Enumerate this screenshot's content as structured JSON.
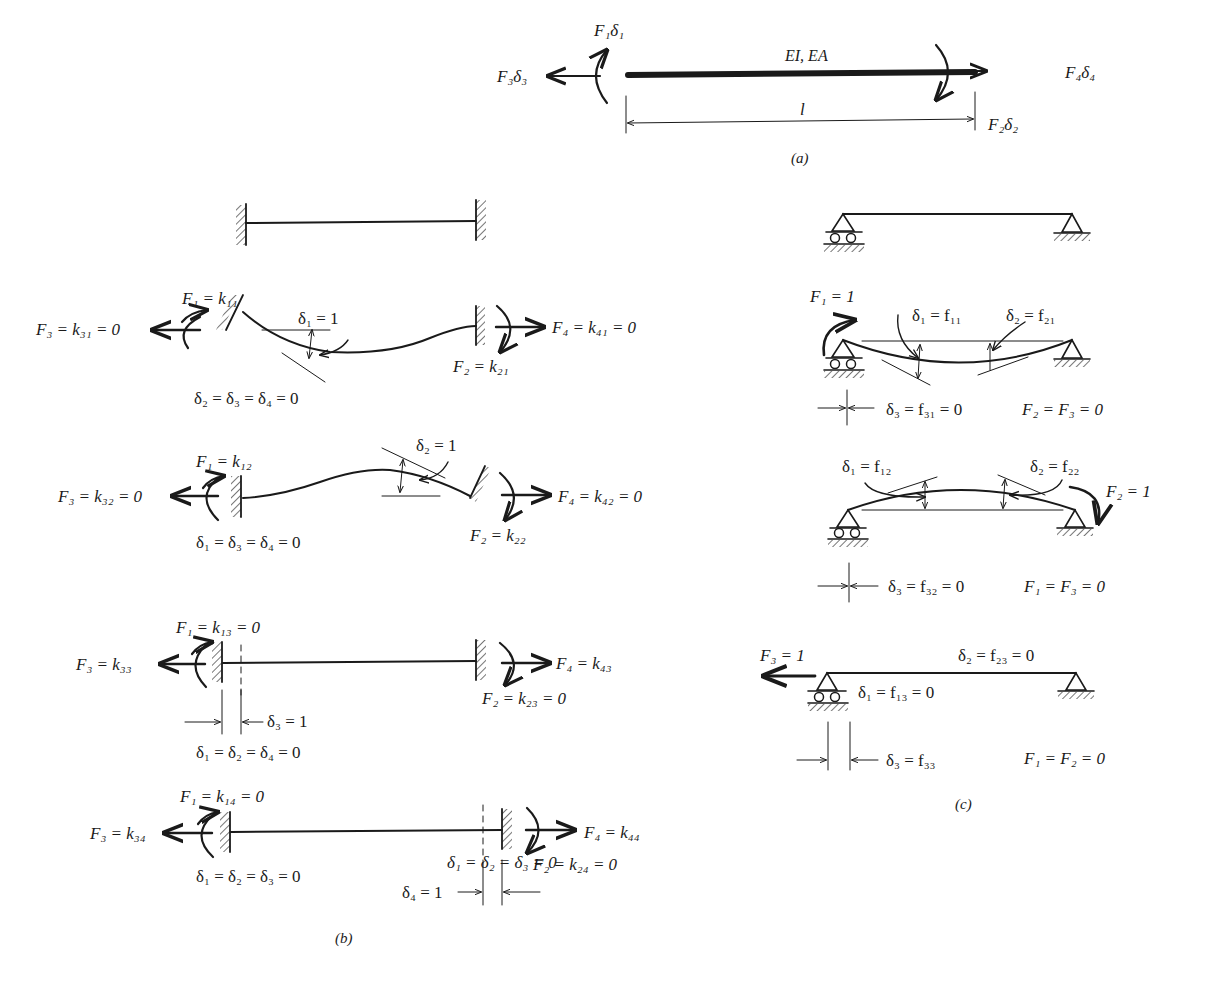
{
  "figure": {
    "panel_a": {
      "caption": "(a)",
      "beam_label": "EI, EA",
      "length_label": "l",
      "labels": {
        "f1": "F₁δ₁",
        "f2": "F₂δ₂",
        "f3": "F₃δ₃",
        "f4": "F₄δ₄"
      }
    },
    "panel_b": {
      "caption": "(b)",
      "case1": {
        "f1": "F₁ = k₁₁",
        "f3": "F₃ = k₃₁ = 0",
        "f4": "F₄ = k₄₁ = 0",
        "f2": "F₂ = k₂₁",
        "d": "δ₁ = 1",
        "cond": "δ₂ = δ₃ = δ₄ = 0"
      },
      "case2": {
        "f1": "F₁ = k₁₂",
        "f3": "F₃ = k₃₂ = 0",
        "f4": "F₄ = k₄₂ = 0",
        "f2": "F₂ = k₂₂",
        "d": "δ₂ = 1",
        "cond": "δ₁ = δ₃ = δ₄ = 0"
      },
      "case3": {
        "f1": "F₁ = k₁₃ = 0",
        "f3": "F₃ = k₃₃",
        "f4": "F₄ = k₄₃",
        "f2": "F₂ = k₂₃ = 0",
        "d": "δ₃ = 1",
        "cond": "δ₁ = δ₂ = δ₄ = 0"
      },
      "case4": {
        "f1": "F₁ = k₁₄ = 0",
        "f3": "F₃ = k₃₄",
        "f4": "F₄ = k₄₄",
        "f2": "F₂ = k₂₄ = 0",
        "d": "δ₄ = 1",
        "cond": "δ₁ = δ₂ = δ₃ = 0"
      }
    },
    "panel_c": {
      "caption": "(c)",
      "case1": {
        "force": "F₁ = 1",
        "d1": "δ₁ = f₁₁",
        "d2": "δ₂ = f₂₁",
        "d3": "δ₃ = f₃₁ = 0",
        "cond": "F₂ = F₃ = 0"
      },
      "case2": {
        "force": "F₂ = 1",
        "d1": "δ₁ = f₁₂",
        "d2": "δ₂ = f₂₂",
        "d3": "δ₃ = f₃₂ = 0",
        "cond": "F₁ = F₃ = 0"
      },
      "case3": {
        "force": "F₃ = 1",
        "d1": "δ₁ = f₁₃ = 0",
        "d2": "δ₂ = f₂₃ = 0",
        "d3": "δ₃ = f₃₃",
        "cond": "F₁ = F₂ = 0"
      }
    }
  }
}
